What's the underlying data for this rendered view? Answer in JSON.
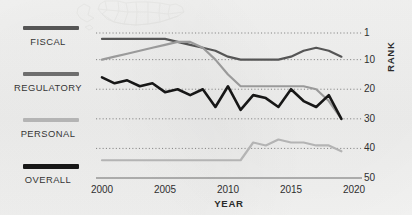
{
  "chart_data": {
    "type": "line",
    "title": "",
    "xlabel": "YEAR",
    "ylabel": "RANK",
    "xlim": [
      2000,
      2020
    ],
    "ylim": [
      1,
      50
    ],
    "y_inverted": true,
    "grid": "dotted-horizontal",
    "legend_position": "left",
    "x_ticks": [
      "2000",
      "2005",
      "2010",
      "2015",
      "2020"
    ],
    "x_tick_values": [
      2000,
      2005,
      2010,
      2015,
      2020
    ],
    "y_ticks": [
      "1",
      "10",
      "20",
      "30",
      "40",
      "50"
    ],
    "y_tick_values": [
      1,
      10,
      20,
      30,
      40,
      50
    ],
    "x": [
      2000,
      2001,
      2002,
      2003,
      2004,
      2005,
      2006,
      2007,
      2008,
      2009,
      2010,
      2011,
      2012,
      2013,
      2014,
      2015,
      2016,
      2017,
      2018,
      2019
    ],
    "series": [
      {
        "name": "FISCAL",
        "color": "#555555",
        "values": [
          3,
          3,
          3,
          3,
          3,
          3,
          4,
          5,
          6,
          7,
          9,
          10,
          10,
          10,
          10,
          9,
          7,
          6,
          7,
          9
        ]
      },
      {
        "name": "REGULATORY",
        "color": "#9a9a9a",
        "values": [
          10,
          9,
          8,
          7,
          6,
          5,
          4,
          4,
          6,
          10,
          15,
          19,
          19,
          19,
          19,
          19,
          19,
          20,
          24,
          30
        ]
      },
      {
        "name": "PERSONAL",
        "color": "#b4b4b4",
        "values": [
          44,
          44,
          44,
          44,
          44,
          44,
          44,
          44,
          44,
          44,
          44,
          44,
          38,
          39,
          37,
          38,
          38,
          39,
          39,
          41
        ]
      },
      {
        "name": "OVERALL",
        "color": "#171717",
        "values": [
          16,
          18,
          17,
          19,
          18,
          21,
          20,
          22,
          20,
          26,
          19,
          27,
          22,
          23,
          26,
          20,
          24,
          26,
          22,
          30
        ]
      }
    ],
    "annotations": {
      "map_watermark": "united-states-map"
    }
  },
  "legend": {
    "items": [
      {
        "label": "FISCAL",
        "color": "#555555"
      },
      {
        "label": "REGULATORY",
        "color": "#6e6e6e"
      },
      {
        "label": "PERSONAL",
        "color": "#b4b4b4"
      },
      {
        "label": "OVERALL",
        "color": "#171717"
      }
    ]
  },
  "axes": {
    "y_title": "RANK",
    "x_title": "YEAR"
  }
}
